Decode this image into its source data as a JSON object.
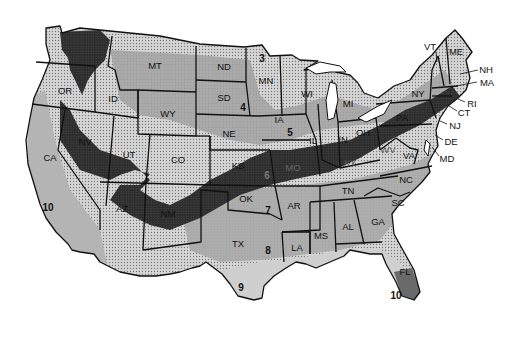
{
  "map": {
    "title": "",
    "type": "US plant hardiness zone map (contiguous United States)",
    "colors": {
      "background": "#ffffff",
      "light_stipple": "#c8c8c8",
      "medium_gray": "#9a9a9a",
      "dark_band": "#2e2e2e",
      "florida_south": "#6a6a6a",
      "border": "#111111"
    },
    "state_labels": [
      {
        "id": "WA",
        "text": "",
        "x": 62,
        "y": 40
      },
      {
        "id": "OR",
        "text": "OR",
        "x": 65,
        "y": 91
      },
      {
        "id": "ID",
        "text": "ID",
        "x": 113,
        "y": 99
      },
      {
        "id": "MT",
        "text": "MT",
        "x": 155,
        "y": 66
      },
      {
        "id": "ND",
        "text": "ND",
        "x": 224,
        "y": 67
      },
      {
        "id": "SD",
        "text": "SD",
        "x": 224,
        "y": 98
      },
      {
        "id": "WY",
        "text": "WY",
        "x": 168,
        "y": 114
      },
      {
        "id": "NE",
        "text": "NE",
        "x": 229,
        "y": 134
      },
      {
        "id": "NV",
        "text": "NV",
        "x": 85,
        "y": 142
      },
      {
        "id": "UT",
        "text": "UT",
        "x": 129,
        "y": 155
      },
      {
        "id": "CO",
        "text": "CO",
        "x": 178,
        "y": 160
      },
      {
        "id": "CA",
        "text": "CA",
        "x": 50,
        "y": 158
      },
      {
        "id": "KS",
        "text": "KS",
        "x": 238,
        "y": 166
      },
      {
        "id": "MN",
        "text": "MN",
        "x": 266,
        "y": 81
      },
      {
        "id": "IA",
        "text": "IA",
        "x": 279,
        "y": 120
      },
      {
        "id": "WI",
        "text": "WI",
        "x": 307,
        "y": 94
      },
      {
        "id": "MI",
        "text": "MI",
        "x": 348,
        "y": 104
      },
      {
        "id": "IL",
        "text": "IL",
        "x": 313,
        "y": 141
      },
      {
        "id": "IN",
        "text": "IN",
        "x": 343,
        "y": 140
      },
      {
        "id": "OH",
        "text": "OH",
        "x": 363,
        "y": 133
      },
      {
        "id": "MO",
        "text": "MO",
        "x": 293,
        "y": 168
      },
      {
        "id": "KY",
        "text": "KY",
        "x": 350,
        "y": 163
      },
      {
        "id": "PA",
        "text": "PA",
        "x": 402,
        "y": 118
      },
      {
        "id": "NY",
        "text": "NY",
        "x": 418,
        "y": 94
      },
      {
        "id": "VA",
        "text": "VA",
        "x": 409,
        "y": 156
      },
      {
        "id": "WV",
        "text": "WV",
        "x": 388,
        "y": 150
      },
      {
        "id": "TN",
        "text": "TN",
        "x": 348,
        "y": 191
      },
      {
        "id": "NC",
        "text": "NC",
        "x": 406,
        "y": 180
      },
      {
        "id": "SC",
        "text": "SC",
        "x": 398,
        "y": 203
      },
      {
        "id": "OK",
        "text": "OK",
        "x": 246,
        "y": 199
      },
      {
        "id": "AR",
        "text": "AR",
        "x": 294,
        "y": 206
      },
      {
        "id": "MS",
        "text": "MS",
        "x": 321,
        "y": 236
      },
      {
        "id": "AL",
        "text": "AL",
        "x": 348,
        "y": 227
      },
      {
        "id": "GA",
        "text": "GA",
        "x": 378,
        "y": 222
      },
      {
        "id": "LA",
        "text": "LA",
        "x": 297,
        "y": 248
      },
      {
        "id": "TX",
        "text": "TX",
        "x": 238,
        "y": 244
      },
      {
        "id": "AZ",
        "text": "AZ",
        "x": 122,
        "y": 209
      },
      {
        "id": "NM",
        "text": "NM",
        "x": 168,
        "y": 214
      },
      {
        "id": "FL",
        "text": "FL",
        "x": 405,
        "y": 272
      }
    ],
    "callout_labels": [
      {
        "id": "VT",
        "text": "VT",
        "x": 430,
        "y": 47,
        "line": [
          436,
          52,
          437,
          62
        ]
      },
      {
        "id": "ME",
        "text": "ME",
        "x": 456,
        "y": 52,
        "line": null
      },
      {
        "id": "NH",
        "text": "NH",
        "x": 486,
        "y": 70,
        "line": [
          478,
          70,
          460,
          74
        ]
      },
      {
        "id": "MA",
        "text": "MA",
        "x": 487,
        "y": 83,
        "line": [
          477,
          82,
          456,
          86
        ]
      },
      {
        "id": "RI",
        "text": "RI",
        "x": 472,
        "y": 104,
        "line": [
          465,
          102,
          458,
          99
        ]
      },
      {
        "id": "CT",
        "text": "CT",
        "x": 464,
        "y": 113,
        "line": [
          457,
          111,
          449,
          106
        ]
      },
      {
        "id": "NJ",
        "text": "NJ",
        "x": 455,
        "y": 126,
        "line": [
          447,
          124,
          440,
          121
        ]
      },
      {
        "id": "DE",
        "text": "DE",
        "x": 451,
        "y": 142,
        "line": [
          443,
          140,
          435,
          135
        ]
      },
      {
        "id": "MD",
        "text": "MD",
        "x": 447,
        "y": 159,
        "line": [
          439,
          156,
          432,
          147
        ]
      }
    ],
    "zone_labels": [
      {
        "zone": "3",
        "x": 262,
        "y": 59
      },
      {
        "zone": "4",
        "x": 243,
        "y": 108
      },
      {
        "zone": "5",
        "x": 290,
        "y": 133
      },
      {
        "zone": "6",
        "x": 267,
        "y": 176
      },
      {
        "zone": "7",
        "x": 268,
        "y": 211
      },
      {
        "zone": "8",
        "x": 268,
        "y": 251
      },
      {
        "zone": "9",
        "x": 241,
        "y": 288
      },
      {
        "zone": "10",
        "x": 48,
        "y": 208
      },
      {
        "zone": "10",
        "x": 396,
        "y": 296
      }
    ]
  }
}
